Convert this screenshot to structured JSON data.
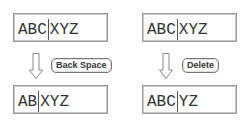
{
  "left": {
    "before": {
      "left": "ABC",
      "right": "XYZ"
    },
    "key": "Back Space",
    "after": {
      "left": "AB",
      "right": "XYZ"
    }
  },
  "right": {
    "before": {
      "left": "ABC",
      "right": "XYZ"
    },
    "key": "Delete",
    "after": {
      "left": "ABC",
      "right": "YZ"
    }
  }
}
